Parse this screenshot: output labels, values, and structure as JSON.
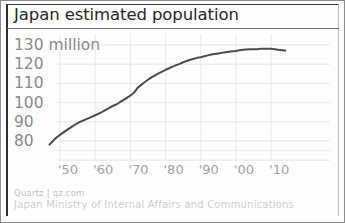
{
  "figure": {
    "title": "Japan estimated population",
    "credit_line_1": "Quartz | qz.com",
    "credit_line_2": "Japan Ministry of Internal Affairs and Communications",
    "line_color": "#4b4b4b",
    "grid_color": "#e2e2e2",
    "label_color": "#8a8a8a",
    "title_color": "#272727"
  },
  "chart_data": {
    "type": "line",
    "title": "Japan estimated population",
    "xlabel": "",
    "ylabel": "",
    "unit_note": "million",
    "grid": true,
    "legend": false,
    "xlim": [
      1947,
      2014
    ],
    "ylim": [
      76,
      133
    ],
    "ytick_labels": [
      "130 million",
      "120",
      "110",
      "100",
      "90",
      "80"
    ],
    "ytick_values": [
      130,
      120,
      110,
      100,
      90,
      80
    ],
    "xtick_labels": [
      "'50",
      "'60",
      "'70",
      "'80",
      "'90",
      "'00",
      "'10"
    ],
    "xtick_values": [
      1950,
      1960,
      1970,
      1980,
      1990,
      2000,
      2010
    ],
    "series": [
      {
        "name": "Japan estimated population (millions)",
        "x": [
          1947,
          1948,
          1949,
          1950,
          1951,
          1952,
          1953,
          1954,
          1955,
          1956,
          1957,
          1958,
          1959,
          1960,
          1961,
          1962,
          1963,
          1964,
          1965,
          1966,
          1967,
          1968,
          1969,
          1970,
          1971,
          1972,
          1973,
          1974,
          1975,
          1976,
          1977,
          1978,
          1979,
          1980,
          1981,
          1982,
          1983,
          1984,
          1985,
          1986,
          1987,
          1988,
          1989,
          1990,
          1991,
          1992,
          1993,
          1994,
          1995,
          1996,
          1997,
          1998,
          1999,
          2000,
          2001,
          2002,
          2003,
          2004,
          2005,
          2006,
          2007,
          2008,
          2009,
          2010,
          2011,
          2012,
          2013,
          2014
        ],
        "y": [
          78.1,
          80.0,
          81.8,
          83.2,
          84.5,
          85.8,
          87.0,
          88.2,
          89.3,
          90.2,
          91.0,
          91.8,
          92.6,
          93.4,
          94.3,
          95.2,
          96.2,
          97.2,
          98.3,
          99.0,
          100.2,
          101.3,
          102.5,
          103.7,
          105.1,
          107.6,
          109.1,
          110.6,
          111.9,
          113.1,
          114.2,
          115.2,
          116.1,
          117.1,
          117.9,
          118.7,
          119.5,
          120.2,
          121.0,
          121.7,
          122.3,
          122.8,
          123.3,
          123.6,
          124.1,
          124.6,
          125.0,
          125.3,
          125.6,
          125.9,
          126.2,
          126.5,
          126.7,
          126.9,
          127.3,
          127.5,
          127.7,
          127.8,
          127.8,
          127.8,
          128.0,
          128.1,
          128.0,
          128.1,
          127.8,
          127.5,
          127.3,
          127.1
        ]
      }
    ]
  }
}
